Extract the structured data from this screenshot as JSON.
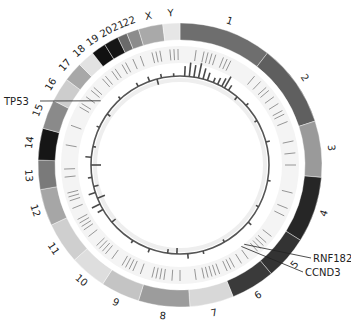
{
  "figure": {
    "type": "circos-genome-plot",
    "center": [
      180,
      165
    ],
    "outer_ring": {
      "r_inner": 125,
      "r_outer": 142
    },
    "feature_track": {
      "r_inner": 102,
      "r_outer": 119
    },
    "data_track": {
      "r_base": 89
    },
    "chromosomes": [
      {
        "name": "1",
        "start": 0,
        "end": 38,
        "color": "#6e6e6e"
      },
      {
        "name": "2",
        "start": 38,
        "end": 72,
        "color": "#5f5f5f"
      },
      {
        "name": "3",
        "start": 72,
        "end": 95,
        "color": "#9a9a9a"
      },
      {
        "name": "4",
        "start": 95,
        "end": 122,
        "color": "#262626"
      },
      {
        "name": "5",
        "start": 122,
        "end": 140,
        "color": "#333333"
      },
      {
        "name": "6",
        "start": 140,
        "end": 158,
        "color": "#3a3a3a"
      },
      {
        "name": "7",
        "start": 158,
        "end": 176,
        "color": "#d8d8d8"
      },
      {
        "name": "8",
        "start": 176,
        "end": 197,
        "color": "#9c9c9c"
      },
      {
        "name": "9",
        "start": 197,
        "end": 213,
        "color": "#c4c4c4"
      },
      {
        "name": "10",
        "start": 213,
        "end": 228,
        "color": "#dedede"
      },
      {
        "name": "11",
        "start": 228,
        "end": 245,
        "color": "#cfcfcf"
      },
      {
        "name": "12",
        "start": 245,
        "end": 260,
        "color": "#a6a6a6"
      },
      {
        "name": "13",
        "start": 260,
        "end": 272,
        "color": "#7a7a7a"
      },
      {
        "name": "14",
        "start": 272,
        "end": 285,
        "color": "#161616"
      },
      {
        "name": "15",
        "start": 285,
        "end": 297,
        "color": "#8a8a8a"
      },
      {
        "name": "16",
        "start": 297,
        "end": 307,
        "color": "#cdcdcd"
      },
      {
        "name": "17",
        "start": 307,
        "end": 315,
        "color": "#a8a8a8"
      },
      {
        "name": "18",
        "start": 315,
        "end": 322,
        "color": "#e2e2e2"
      },
      {
        "name": "19",
        "start": 322,
        "end": 328,
        "color": "#111111"
      },
      {
        "name": "20",
        "start": 328,
        "end": 334,
        "color": "#151515"
      },
      {
        "name": "21",
        "start": 334,
        "end": 338,
        "color": "#6a6a6a"
      },
      {
        "name": "22",
        "start": 338,
        "end": 343,
        "color": "#8c8c8c"
      },
      {
        "name": "X",
        "start": 343,
        "end": 353,
        "color": "#a9a9a9"
      },
      {
        "name": "Y",
        "start": 353,
        "end": 360,
        "color": "#e6e6e6"
      }
    ],
    "gene_labels": [
      {
        "name": "TP53",
        "angle": 309,
        "text_x": 4,
        "text_y": 105,
        "anchor": "start",
        "line_end": [
          40,
          101
        ]
      },
      {
        "name": "RNF182",
        "angle": 141,
        "text_x": 313,
        "text_y": 262,
        "anchor": "start",
        "line_end": [
          311,
          258
        ]
      },
      {
        "name": "CCND3",
        "angle": 143,
        "text_x": 305,
        "text_y": 276,
        "anchor": "start",
        "line_end": [
          303,
          272
        ]
      }
    ],
    "feature_ticks": [
      355,
      357,
      359,
      8,
      12,
      14,
      16,
      18,
      22,
      24,
      26,
      40,
      44,
      48,
      50,
      54,
      58,
      62,
      64,
      68,
      78,
      84,
      90,
      104,
      112,
      116,
      128,
      132,
      134,
      136,
      138,
      144,
      148,
      152,
      154,
      156,
      160,
      162,
      164,
      166,
      168,
      172,
      180,
      184,
      188,
      190,
      192,
      194,
      200,
      204,
      206,
      208,
      210,
      216,
      220,
      222,
      224,
      226,
      232,
      236,
      238,
      240,
      242,
      248,
      252,
      254,
      256,
      264,
      268,
      280,
      290,
      300,
      302,
      306,
      310,
      312,
      318,
      320,
      324,
      326,
      330,
      332,
      336,
      340,
      346,
      348,
      350
    ],
    "data_bars": [
      {
        "angle": 3,
        "h": 10
      },
      {
        "angle": 6,
        "h": 14
      },
      {
        "angle": 9,
        "h": 12
      },
      {
        "angle": 12,
        "h": 15
      },
      {
        "angle": 15,
        "h": 11
      },
      {
        "angle": 18,
        "h": 8
      },
      {
        "angle": 22,
        "h": 5
      },
      {
        "angle": 25,
        "h": 7
      },
      {
        "angle": 28,
        "h": 9
      },
      {
        "angle": 30,
        "h": 13
      },
      {
        "angle": 33,
        "h": 6
      },
      {
        "angle": 40,
        "h": -4
      },
      {
        "angle": 48,
        "h": 3
      },
      {
        "angle": 60,
        "h": -3
      },
      {
        "angle": 75,
        "h": 4
      },
      {
        "angle": 100,
        "h": 3
      },
      {
        "angle": 118,
        "h": -3
      },
      {
        "angle": 130,
        "h": 4
      },
      {
        "angle": 150,
        "h": -3
      },
      {
        "angle": 165,
        "h": 3
      },
      {
        "angle": 175,
        "h": 5
      },
      {
        "angle": 182,
        "h": -6
      },
      {
        "angle": 188,
        "h": -4
      },
      {
        "angle": 200,
        "h": 4
      },
      {
        "angle": 212,
        "h": 3
      },
      {
        "angle": 230,
        "h": -5
      },
      {
        "angle": 240,
        "h": 6
      },
      {
        "angle": 244,
        "h": 9
      },
      {
        "angle": 248,
        "h": -8
      },
      {
        "angle": 252,
        "h": 7
      },
      {
        "angle": 256,
        "h": -5
      },
      {
        "angle": 262,
        "h": 4
      },
      {
        "angle": 270,
        "h": -10
      },
      {
        "angle": 275,
        "h": 6
      },
      {
        "angle": 282,
        "h": -3
      },
      {
        "angle": 295,
        "h": 3
      },
      {
        "angle": 305,
        "h": -4
      },
      {
        "angle": 318,
        "h": 3
      },
      {
        "angle": 332,
        "h": 4
      },
      {
        "angle": 340,
        "h": 5
      },
      {
        "angle": 345,
        "h": -6
      },
      {
        "angle": 348,
        "h": 4
      },
      {
        "angle": 356,
        "h": 3
      }
    ]
  }
}
